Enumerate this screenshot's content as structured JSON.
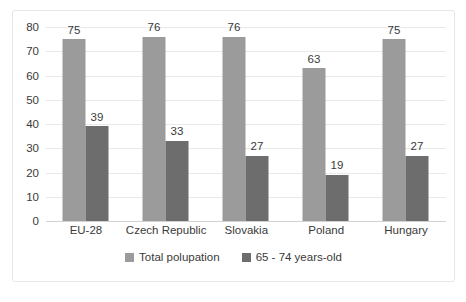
{
  "chart_data": {
    "type": "bar",
    "title": "",
    "xlabel": "",
    "ylabel": "",
    "ylim": [
      0,
      80
    ],
    "ytick_step": 10,
    "yticks": [
      80,
      70,
      60,
      50,
      40,
      30,
      20,
      10,
      0
    ],
    "grid": true,
    "legend_position": "bottom",
    "categories": [
      "EU-28",
      "Czech Republic",
      "Slovakia",
      "Poland",
      "Hungary"
    ],
    "series": [
      {
        "name": "Total polupation",
        "color": "#9b9b9b",
        "values": [
          75,
          76,
          76,
          63,
          75
        ]
      },
      {
        "name": "65 - 74 years-old",
        "color": "#6d6d6d",
        "values": [
          39,
          33,
          27,
          19,
          27
        ]
      }
    ]
  },
  "colors": {
    "series_total": "#9b9b9b",
    "series_elderly": "#6d6d6d",
    "gridline": "#e9e9e9",
    "baseline": "#d2d2d2",
    "border": "#e6e6e6",
    "text": "#3a3a3a",
    "background": "#ffffff"
  }
}
